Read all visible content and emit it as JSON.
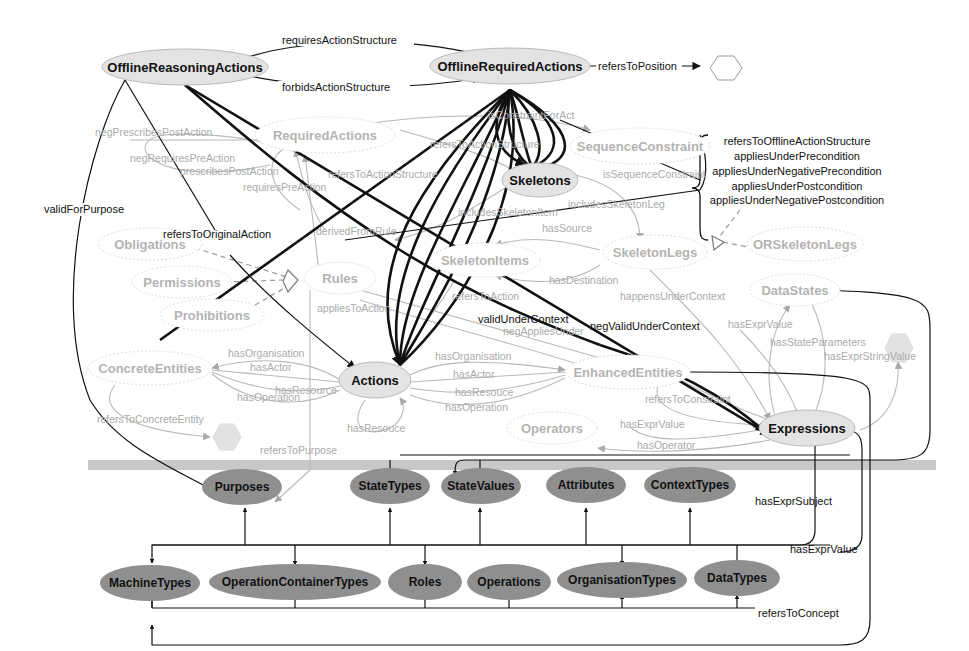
{
  "diagram": {
    "nodes": {
      "offline_reasoning_actions": "OfflineReasoningActions",
      "offline_required_actions": "OfflineRequiredActions",
      "required_actions": "RequiredActions",
      "sequence_constraint": "SequenceConstraint",
      "skeletons": "Skeletons",
      "obligations": "Obligations",
      "permissions": "Permissions",
      "prohibitions": "Prohibitions",
      "rules": "Rules",
      "skeleton_items": "SkeletonItems",
      "skeleton_legs": "SkeletonLegs",
      "or_skeleton_legs": "ORSkeletonLegs",
      "data_states": "DataStates",
      "concrete_entities": "ConcreteEntities",
      "actions": "Actions",
      "enhanced_entities": "EnhancedEntities",
      "operators": "Operators",
      "expressions": "Expressions",
      "purposes": "Purposes",
      "state_types": "StateTypes",
      "state_values": "StateValues",
      "attributes": "Attributes",
      "context_types": "ContextTypes",
      "machine_types": "MachineTypes",
      "operation_container_types": "OperationContainerTypes",
      "roles": "Roles",
      "operations": "Operations",
      "organisation_types": "OrganisationTypes",
      "data_types": "DataTypes"
    },
    "edge_labels": {
      "requires_action_structure": "requiresActionStructure",
      "forbids_action_structure": "forbidsActionStructure",
      "refers_to_position": "refersToPosition",
      "valid_for_purpose": "validForPurpose",
      "neg_prescribes_post_action": "negPrescribesPostAction",
      "neg_requires_pre_action": "negRequiresPreAction",
      "prescribes_post_action": "prescribesPostAction",
      "requires_pre_action": "requiresPreAction",
      "refers_to_action_structure_1": "refersToActionStructure",
      "refers_to_action_structure_2": "refersToActionStructure",
      "constraint_for_act": "isConstraintForAct",
      "is_sequence_constraint": "isSequenceConstraint",
      "includes_skeleton_item": "includesSkeletonItem",
      "includes_skeleton_leg": "includesSkeletonLeg",
      "refers_to_original_action": "refersToOriginalAction",
      "derived_from_rule": "derivedFromRule",
      "has_source": "hasSource",
      "has_destination": "hasDestination",
      "refers_to_action": "refersToAction",
      "applies_to_action": "appliesToAction",
      "happens_under_context": "happensUnderContext",
      "valid_under_context": "validUnderContext",
      "neg_applies_under": "negAppliesUnder",
      "neg_valid_under_context": "negValidUnderContext",
      "has_expr_value_1": "hasExprValue",
      "has_state_parameters": "hasStateParameters",
      "has_expr_string_value": "hasExprStringValue",
      "ce_has_organisation": "hasOrganisation",
      "ce_has_actor": "hasActor",
      "ce_has_resource": "hasResource",
      "ce_has_operation": "hasOperation",
      "ee_has_organisation": "hasOrganisation",
      "ee_has_actor": "hasActor",
      "ee_has_resouce": "hasResouce",
      "ee_has_operation": "hasOperation",
      "has_resouce_self": "hasResouce",
      "refers_to_concrete_entity": "refersToConcreteEntity",
      "refers_to_purpose": "refersToPurpose",
      "refers_to_constraint": "refersToConstraint",
      "has_expr_value_2": "hasExprValue",
      "has_operator": "hasOperator",
      "has_expr_subject": "hasExprSubject",
      "has_expr_value_3": "hasExprValue",
      "refers_to_concept": "refersToConcept"
    },
    "brace_labels": [
      "refersToOfflineActionStructure",
      "appliesUnderPrecondition",
      "appliesUnderNegativePrecondition",
      "appliesUnderPostcondition",
      "appliesUnderNegativePostcondition"
    ],
    "colors": {
      "main_node_fill": "#e3e3e3",
      "faint_node_stroke": "#d0d0d0",
      "dark_node_fill": "#8f8f8f",
      "separator": "#c8c8c8",
      "dark_edge": "#111111",
      "faint_edge": "#b9b9b9"
    }
  }
}
